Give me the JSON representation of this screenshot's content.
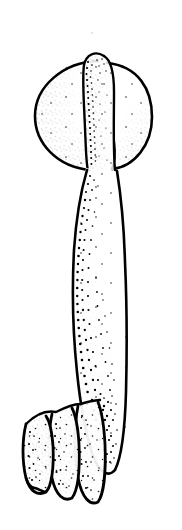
{
  "figure": {
    "domain": "Natural-Image",
    "medium": "ink line drawing with stipple shading",
    "background_color": "#ffffff",
    "ink_color": "#000000",
    "canvas": {
      "width": 182,
      "height": 530
    },
    "alt_text": "Black and white stippled scientific drawing of an elongated specimen with a rounded bulbous head at top, a central tongue-like projection overlying the head, a long tapering body, and three finger-like lobes at the lower left base.",
    "parts": [
      {
        "name": "bulbous-head",
        "label": "Bulbous head",
        "description": "Rounded, nearly circular swollen cap at the top of the specimen, stippled densely along its lower-left and lower-right margins.",
        "center": {
          "x": 92,
          "y": 113
        },
        "radius": {
          "x": 58,
          "y": 52
        }
      },
      {
        "name": "central-projection",
        "label": "Central projection",
        "description": "Narrow tongue-like lobe rising from the body and overlapping the head, its rounded tip reaching the top of the head; its left margin carries the heaviest stipple band.",
        "tip": {
          "x": 104,
          "y": 56
        },
        "base": {
          "x": 100,
          "y": 168
        }
      },
      {
        "name": "body-shaft",
        "label": "Body shaft",
        "description": "Long tapering trunk descending from beneath the head, widest near mid-length then narrowing toward the base; stipple is graded heaviest along the left edge.",
        "top": {
          "x": 88,
          "y": 170
        },
        "bottom": {
          "x": 110,
          "y": 470
        }
      },
      {
        "name": "basal-lobes",
        "label": "Basal lobes",
        "description": "Three overlapping finger-like lobes projecting to the lower left from the base of the body, each outlined in heavy ink and stippled along its left face.",
        "count": 3
      }
    ],
    "observations": {
      "stipple_gradient": "dense along left margins, sparse toward right interiors",
      "line_weight": "variable, heaviest at outer contours and lobe outlines",
      "symmetry": "bilaterally asymmetric; lobes offset to the left",
      "scale_bar_present": false,
      "labels_present": false
    }
  }
}
